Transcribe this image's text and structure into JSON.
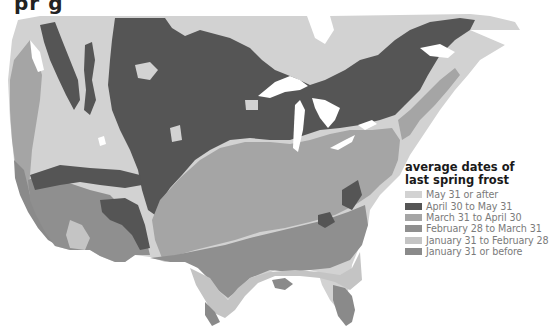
{
  "title_fragment": "pr   g",
  "legend": {
    "title_line1": "average dates of",
    "title_line2": "last spring frost",
    "items": [
      {
        "label": "May 31 or after",
        "color": "#d2d2d2"
      },
      {
        "label": "April 30 to May 31",
        "color": "#555555"
      },
      {
        "label": "March 31 to April 30",
        "color": "#a5a5a5"
      },
      {
        "label": "February 28 to March 31",
        "color": "#8f8f8f"
      },
      {
        "label": "January 31 to February 28",
        "color": "#c4c4c4"
      },
      {
        "label": "January 31 or before",
        "color": "#8a8a8a"
      }
    ]
  },
  "colors": {
    "background": "#ffffff",
    "water": "#ffffff",
    "may31_or_after": "#d2d2d2",
    "apr30_may31": "#555555",
    "mar31_apr30": "#a5a5a5",
    "feb28_mar31": "#8f8f8f",
    "jan31_feb28": "#c4c4c4",
    "jan31_or_before": "#8a8a8a"
  }
}
